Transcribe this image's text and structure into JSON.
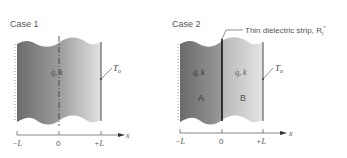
{
  "case1": {
    "title": "Case 1",
    "label_gen": "q̇, k",
    "label_surface_temp": "T",
    "label_surface_temp_sub": "o",
    "axis": {
      "ticks": [
        "−L",
        "0",
        "+L"
      ],
      "axis_label": "x"
    }
  },
  "case2": {
    "title": "Case 2",
    "strip_label": "Thin dielectric strip, R",
    "strip_label_sub": "t",
    "strip_label_sup": "″",
    "region_a": {
      "name": "A",
      "label_gen": "q̇, k"
    },
    "region_b": {
      "name": "B",
      "label_gen": "q̇, k"
    },
    "label_surface_temp": "T",
    "label_surface_temp_sub": "o",
    "axis": {
      "ticks": [
        "−L",
        "0",
        "+L"
      ],
      "axis_label": "x"
    }
  },
  "colors": {
    "dark_fill": "#6f6f6f",
    "light_fill": "#d9d9d9",
    "line": "#333333",
    "text": "#555555"
  }
}
